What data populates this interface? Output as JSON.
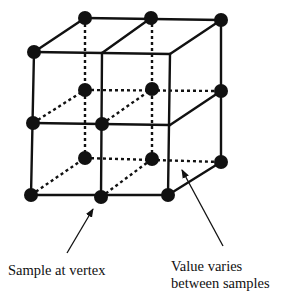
{
  "diagram": {
    "title": "",
    "colors": {
      "ink": "#111111",
      "background": "#ffffff"
    },
    "dot_radius": 7,
    "vertices": [
      {
        "id": "front-top-left",
        "x": 34,
        "y": 52,
        "sample": true
      },
      {
        "id": "front-top-middle",
        "x": 102,
        "y": 53,
        "sample": false
      },
      {
        "id": "front-top-right",
        "x": 170,
        "y": 54,
        "sample": false
      },
      {
        "id": "front-mid-left",
        "x": 33,
        "y": 123,
        "sample": true
      },
      {
        "id": "front-mid-middle",
        "x": 102,
        "y": 124,
        "sample": true
      },
      {
        "id": "front-mid-right",
        "x": 170,
        "y": 125,
        "sample": false
      },
      {
        "id": "front-bottom-left",
        "x": 31,
        "y": 195,
        "sample": true
      },
      {
        "id": "front-bottom-middle",
        "x": 101,
        "y": 197,
        "sample": true
      },
      {
        "id": "front-bottom-right",
        "x": 168,
        "y": 195,
        "sample": true
      },
      {
        "id": "back-top-left",
        "x": 85,
        "y": 18,
        "sample": true
      },
      {
        "id": "back-top-middle",
        "x": 151,
        "y": 18,
        "sample": true
      },
      {
        "id": "back-top-right",
        "x": 221,
        "y": 20,
        "sample": true
      },
      {
        "id": "back-mid-left",
        "x": 85,
        "y": 90,
        "sample": true
      },
      {
        "id": "back-mid-middle",
        "x": 152,
        "y": 89,
        "sample": true
      },
      {
        "id": "back-mid-right",
        "x": 221,
        "y": 91,
        "sample": true
      },
      {
        "id": "back-bottom-left",
        "x": 85,
        "y": 158,
        "sample": true
      },
      {
        "id": "back-bottom-middle",
        "x": 152,
        "y": 159,
        "sample": true
      },
      {
        "id": "back-bottom-right",
        "x": 221,
        "y": 162,
        "sample": true
      }
    ],
    "annotations": [
      {
        "id": "sample-at-vertex",
        "text": "Sample at vertex",
        "arrow_from": [
          67,
          253
        ],
        "arrow_to": [
          94,
          207
        ]
      },
      {
        "id": "value-varies",
        "lines": [
          "Value varies",
          "between samples"
        ],
        "arrow_from": [
          223,
          246
        ],
        "arrow_to": [
          181,
          168
        ]
      }
    ]
  },
  "labels": {
    "sample_at_vertex": "Sample at vertex",
    "value_varies_line1": "Value varies",
    "value_varies_line2": "between samples"
  }
}
